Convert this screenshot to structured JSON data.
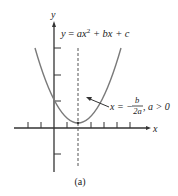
{
  "figure": {
    "caption": "(a)",
    "axes": {
      "x_label": "x",
      "y_label": "y"
    },
    "equation": {
      "lhs": "y",
      "eq": " = ",
      "term1": "ax",
      "term1_exp": "2",
      "rest": " + bx + c"
    },
    "annotation": {
      "lhs": "x = −",
      "frac_num": "b",
      "frac_den": "2a",
      "condition": ", a > 0"
    },
    "colors": {
      "curve": "#7a7a7a",
      "axis": "#333333",
      "dashed": "#555555",
      "text": "#222222"
    }
  }
}
